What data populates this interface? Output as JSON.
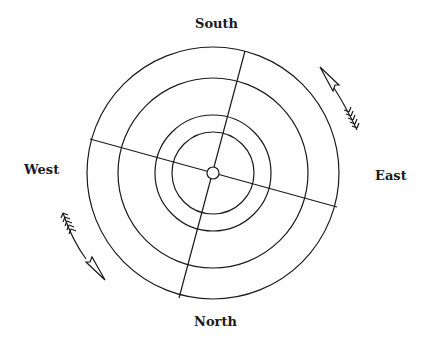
{
  "diagram": {
    "title": "",
    "labels": {
      "south": "South",
      "north": "North",
      "west": "West",
      "east": "East"
    },
    "center": {
      "x": 213,
      "y": 173
    },
    "circles": [
      {
        "name": "outer-ring",
        "r": 126
      },
      {
        "name": "ring-2",
        "r": 95
      },
      {
        "name": "ring-3",
        "r": 58
      },
      {
        "name": "ring-4",
        "r": 41
      },
      {
        "name": "center-hub",
        "r": 6
      }
    ],
    "axes": [
      {
        "name": "south-north-axis",
        "x1": 245,
        "y1": 51,
        "x2": 179,
        "y2": 298
      },
      {
        "name": "west-east-axis",
        "x1": 90,
        "y1": 139,
        "x2": 337,
        "y2": 207
      }
    ],
    "arrows": [
      {
        "name": "east-side-arrow",
        "direction": "counterclockwise-up",
        "position": "upper-right"
      },
      {
        "name": "west-side-arrow",
        "direction": "counterclockwise-down",
        "position": "lower-left"
      }
    ],
    "stroke_color": "#1a1a1a",
    "background_color": "#ffffff"
  }
}
